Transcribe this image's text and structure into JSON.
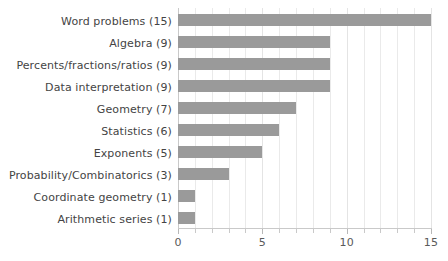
{
  "chart_data": {
    "type": "bar",
    "orientation": "horizontal",
    "title": "",
    "xlabel": "",
    "ylabel": "",
    "xlim": [
      0,
      15
    ],
    "grid": true,
    "legend": false,
    "bar_color": "#9a9a9a",
    "gridline_color": "#eaeaea",
    "axis_color": "#c9c9c9",
    "label_color": "#444444",
    "tick_label_color": "#5a5a5a",
    "xticks": [
      0,
      5,
      10,
      15
    ],
    "xtick_labels": [
      "0",
      "5",
      "10",
      "15"
    ],
    "minor_tick_step": 1,
    "categories": [
      "Word problems (15)",
      "Algebra (9)",
      "Percents/fractions/ratios (9)",
      "Data interpretation (9)",
      "Geometry (7)",
      "Statistics (6)",
      "Exponents (5)",
      "Probability/Combinatorics (3)",
      "Coordinate geometry (1)",
      "Arithmetic series (1)"
    ],
    "values": [
      15,
      9,
      9,
      9,
      7,
      6,
      5,
      3,
      1,
      1
    ]
  }
}
